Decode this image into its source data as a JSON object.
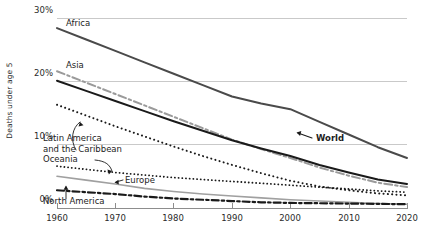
{
  "chart_data": {
    "type": "line",
    "title": "",
    "xlabel": "",
    "ylabel": "Deaths under age 5",
    "xlim": [
      1960,
      2020
    ],
    "ylim": [
      0,
      30
    ],
    "grid": true,
    "legend_position": "inline-labels",
    "y_tick_labels": [
      "30%",
      "20%",
      "10%",
      "0%"
    ],
    "y_ticks": [
      30,
      20,
      10,
      0
    ],
    "x_tick_labels": [
      "1960",
      "1970",
      "1980",
      "1990",
      "2000",
      "2010",
      "2020"
    ],
    "x": [
      1960,
      1965,
      1970,
      1975,
      1980,
      1985,
      1990,
      1995,
      2000,
      2005,
      2010,
      2015,
      2020
    ],
    "series": [
      {
        "name": "Africa",
        "style": "solid-dark",
        "color": "#4a4a4a",
        "values": [
          28.4,
          26.6,
          24.8,
          23.0,
          21.2,
          19.4,
          17.6,
          16.5,
          15.6,
          13.6,
          11.6,
          9.6,
          7.9
        ]
      },
      {
        "name": "Asia",
        "style": "dash-dot-gray",
        "color": "#9a9a9a",
        "values": [
          21.6,
          19.8,
          18.0,
          16.2,
          14.4,
          12.6,
          10.8,
          9.3,
          7.9,
          6.4,
          5.1,
          4.0,
          3.3
        ]
      },
      {
        "name": "World",
        "style": "solid-black",
        "color": "#1a1a1a",
        "values": [
          20.1,
          18.5,
          16.9,
          15.3,
          13.7,
          12.2,
          10.7,
          9.4,
          8.2,
          6.8,
          5.6,
          4.5,
          3.8
        ]
      },
      {
        "name": "Latin America and the Caribbean",
        "style": "dotted-black",
        "color": "#1a1a1a",
        "values": [
          16.3,
          14.6,
          12.9,
          11.3,
          9.7,
          8.2,
          6.8,
          5.5,
          4.3,
          3.4,
          2.8,
          2.3,
          2.0
        ]
      },
      {
        "name": "Oceania",
        "style": "dotted-black-small",
        "color": "#1a1a1a",
        "values": [
          6.6,
          6.1,
          5.6,
          5.2,
          4.8,
          4.5,
          4.2,
          3.9,
          3.6,
          3.3,
          3.0,
          2.7,
          2.5
        ]
      },
      {
        "name": "Europe",
        "style": "solid-gray",
        "color": "#a0a0a0",
        "values": [
          5.0,
          4.4,
          3.8,
          3.1,
          2.6,
          2.2,
          1.9,
          1.6,
          1.3,
          1.1,
          0.9,
          0.7,
          0.6
        ]
      },
      {
        "name": "North America",
        "style": "dash-dot-black",
        "color": "#1a1a1a",
        "values": [
          2.8,
          2.5,
          2.2,
          1.8,
          1.5,
          1.3,
          1.1,
          0.9,
          0.8,
          0.75,
          0.7,
          0.65,
          0.6
        ]
      }
    ],
    "annotations": [
      {
        "label": "Africa",
        "x": 1962,
        "y": 29.4
      },
      {
        "label": "Asia",
        "x": 1962,
        "y": 22.6
      },
      {
        "label": "World",
        "x": 2002,
        "y": 10.4
      },
      {
        "label": "Latin America and the Caribbean",
        "x": 1962,
        "y": 12.3
      },
      {
        "label": "Oceania",
        "x": 1962,
        "y": 8.3
      },
      {
        "label": "Europe",
        "x": 1972,
        "y": 4.0
      },
      {
        "label": "North America",
        "x": 1962,
        "y": 0.6
      }
    ]
  },
  "axes": {
    "y_title": "Deaths under age 5",
    "y_ticks": [
      {
        "label": "30%",
        "top": 13
      },
      {
        "label": "20%",
        "top": 76
      },
      {
        "label": "10%",
        "top": 139
      },
      {
        "label": "0%",
        "top": 202
      }
    ],
    "x_ticks": [
      {
        "label": "1960",
        "left": 57
      },
      {
        "label": "1970",
        "left": 115
      },
      {
        "label": "1980",
        "left": 173
      },
      {
        "label": "1990",
        "left": 232
      },
      {
        "label": "2000",
        "left": 290
      },
      {
        "label": "2010",
        "left": 349
      },
      {
        "label": "2020",
        "left": 407
      }
    ]
  },
  "labels": {
    "africa": "Africa",
    "asia": "Asia",
    "world": "World",
    "latin_america_line1": "Latin America",
    "latin_america_line2": "and the Caribbean",
    "oceania": "Oceania",
    "europe": "Europe",
    "north_america": "North America"
  }
}
